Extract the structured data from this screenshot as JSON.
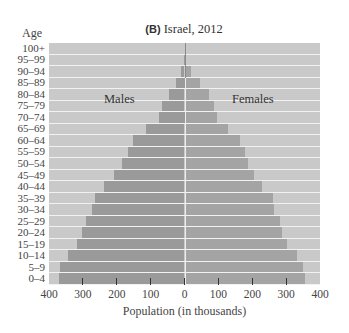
{
  "chart_data": {
    "type": "bar",
    "orientation": "horizontal",
    "subtype": "population-pyramid",
    "title": "(B) Israel, 2012",
    "title_tag": "(B)",
    "title_text": "Israel, 2012",
    "ylabel": "Age",
    "xlabel": "Population (in thousands)",
    "xlim": [
      -400,
      400
    ],
    "x_ticks": [
      -400,
      -300,
      -200,
      -100,
      0,
      100,
      200,
      300,
      400
    ],
    "x_tick_labels": [
      "400",
      "300",
      "200",
      "100",
      "0",
      "100",
      "200",
      "300",
      "400"
    ],
    "categories": [
      "0–4",
      "5–9",
      "10–14",
      "15–19",
      "20–24",
      "25–29",
      "30–34",
      "35–39",
      "40–44",
      "45–49",
      "50–54",
      "55–59",
      "60–64",
      "65–69",
      "70–74",
      "75–79",
      "80–84",
      "85–89",
      "90–94",
      "95–99",
      "100+"
    ],
    "series": [
      {
        "name": "Males",
        "side": "left",
        "color": "#9a9a9a",
        "values": [
          371,
          367,
          343,
          316,
          302,
          291,
          274,
          264,
          237,
          208,
          184,
          168,
          151,
          113,
          75,
          66,
          45,
          25,
          10,
          1,
          0
        ]
      },
      {
        "name": "Females",
        "side": "right",
        "color": "#a4a4a4",
        "values": [
          355,
          351,
          331,
          304,
          288,
          281,
          263,
          260,
          230,
          206,
          186,
          178,
          164,
          129,
          96,
          88,
          71,
          45,
          18,
          2,
          0
        ]
      }
    ],
    "annotations": [
      {
        "text": "Males",
        "position": "left-upper"
      },
      {
        "text": "Females",
        "position": "right-upper"
      }
    ],
    "grid": false,
    "legend": "inline labels",
    "background_color": "#c9c9c9"
  }
}
